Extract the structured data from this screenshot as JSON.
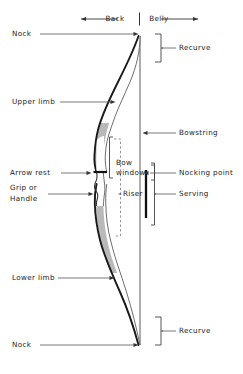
{
  "diagram": {
    "orientation_axis": {
      "back_label": "Back",
      "belly_label": "Belly"
    },
    "labels": {
      "nock_top": "Nock",
      "upper_limb": "Upper limb",
      "arrow_rest": "Arrow rest",
      "grip_or_handle_line1": "Grip or",
      "grip_or_handle_line2": "Handle",
      "lower_limb": "Lower limb",
      "nock_bottom": "Nock",
      "recurve_top": "Recurve",
      "bowstring": "Bowstring",
      "nocking_point": "Nocking point",
      "serving": "Serving",
      "recurve_bottom": "Recurve",
      "bow_window_line1": "Bow",
      "bow_window_line2": "window",
      "riser": "Riser"
    },
    "colors": {
      "ink": "#1a1a1a",
      "limb_fill": "#b9b9b9",
      "leader": "#555555",
      "dashed": "#8a8a8a",
      "background": "#ffffff"
    }
  }
}
